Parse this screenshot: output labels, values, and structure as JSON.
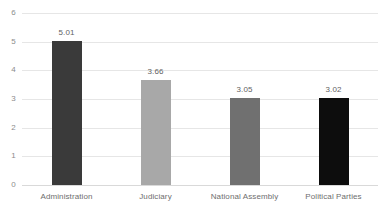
{
  "chart_data": {
    "type": "bar",
    "title": "",
    "subtitle": "",
    "xlabel": "",
    "ylabel": "",
    "categories": [
      "Administration",
      "Judiciary",
      "National Assembly",
      "Political Parties"
    ],
    "values": [
      5.01,
      3.66,
      3.05,
      3.02
    ],
    "data_labels": [
      "5.01",
      "3.66",
      "3.05",
      "3.02"
    ],
    "bar_colors": [
      "#3a3a3a",
      "#a8a8a8",
      "#707070",
      "#0d0d0d"
    ],
    "ylim": [
      0,
      6
    ],
    "ytick_labels": [
      "0",
      "1",
      "2",
      "3",
      "4",
      "5",
      "6"
    ],
    "ytick_values": [
      0,
      1,
      2,
      3,
      4,
      5,
      6
    ],
    "grid": true,
    "grid_axis": "y",
    "grid_color": "#e6e6e6",
    "legend": false,
    "legend_position": "none",
    "background_color": "#ffffff",
    "axis_label_color": "#8c8c8c",
    "value_label_color": "#5f5f5f"
  }
}
